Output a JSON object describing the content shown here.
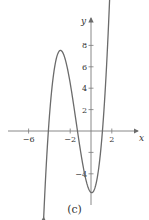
{
  "chart_data": {
    "type": "line",
    "title": "",
    "caption": "(c)",
    "xlabel": "x",
    "ylabel": "y",
    "xlim": [
      -8.5,
      4.5
    ],
    "ylim": [
      -8,
      9.5
    ],
    "x_ticks": [
      -6,
      -2,
      2
    ],
    "x_tick_labels": [
      "−6",
      "−2",
      "2"
    ],
    "y_ticks": [
      8,
      6,
      4,
      2,
      -2,
      -4
    ],
    "y_tick_labels": [
      "8",
      "6",
      "4",
      "2",
      "",
      "−4"
    ],
    "grid": false,
    "series": [
      {
        "name": "cubic",
        "description": "Cubic curve with local max ≈ (-3, 8) and local min ≈ (0, -4); x-intercepts ≈ -4.1, -1.3, 1.1; arrows at both ends",
        "x": [
          -4.5,
          -4.1,
          -3.5,
          -3,
          -2.5,
          -2,
          -1.3,
          -1,
          -0.5,
          0,
          0.5,
          1.1,
          1.5,
          2
        ],
        "y": [
          -7.2,
          0,
          6.5,
          8,
          6.8,
          4,
          0,
          -1.5,
          -3.4,
          -4,
          -3.2,
          0,
          3.5,
          8.5
        ]
      }
    ],
    "colors": {
      "curve": "#6b6b6b",
      "axis": "#7a7a7a"
    }
  }
}
